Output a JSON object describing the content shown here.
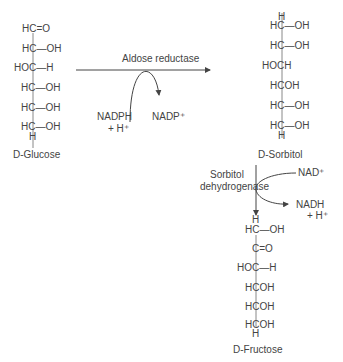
{
  "glucose": {
    "name": "D-Glucose",
    "rows": [
      "HC=O",
      "HC—OH",
      "HOC—H",
      "HC—OH",
      "HC—OH",
      "HC—OH"
    ],
    "bottom": "H"
  },
  "sorbitol": {
    "name": "D-Sorbitol",
    "top": "H",
    "rows": [
      "HC—OH",
      "HC—OH",
      "HOCH",
      "HCOH",
      "HC—OH",
      "HC—OH"
    ],
    "bottom": "H"
  },
  "fructose": {
    "name": "D-Fructose",
    "top": "H",
    "rows": [
      "HC—OH",
      "C=O",
      "HOC—H",
      "HCOH",
      "HCOH",
      "HCOH"
    ],
    "bottom": "H"
  },
  "reaction1": {
    "enzyme": "Aldose reductase",
    "cofactor_in": "NADPH",
    "cofactor_in_2": "+ H⁺",
    "cofactor_out": "NADP⁺"
  },
  "reaction2": {
    "enzyme_line1": "Sorbitol",
    "enzyme_line2": "dehydrogenase",
    "cofactor_in": "NAD⁺",
    "cofactor_out": "NADH",
    "cofactor_out_2": "+ H⁺"
  }
}
